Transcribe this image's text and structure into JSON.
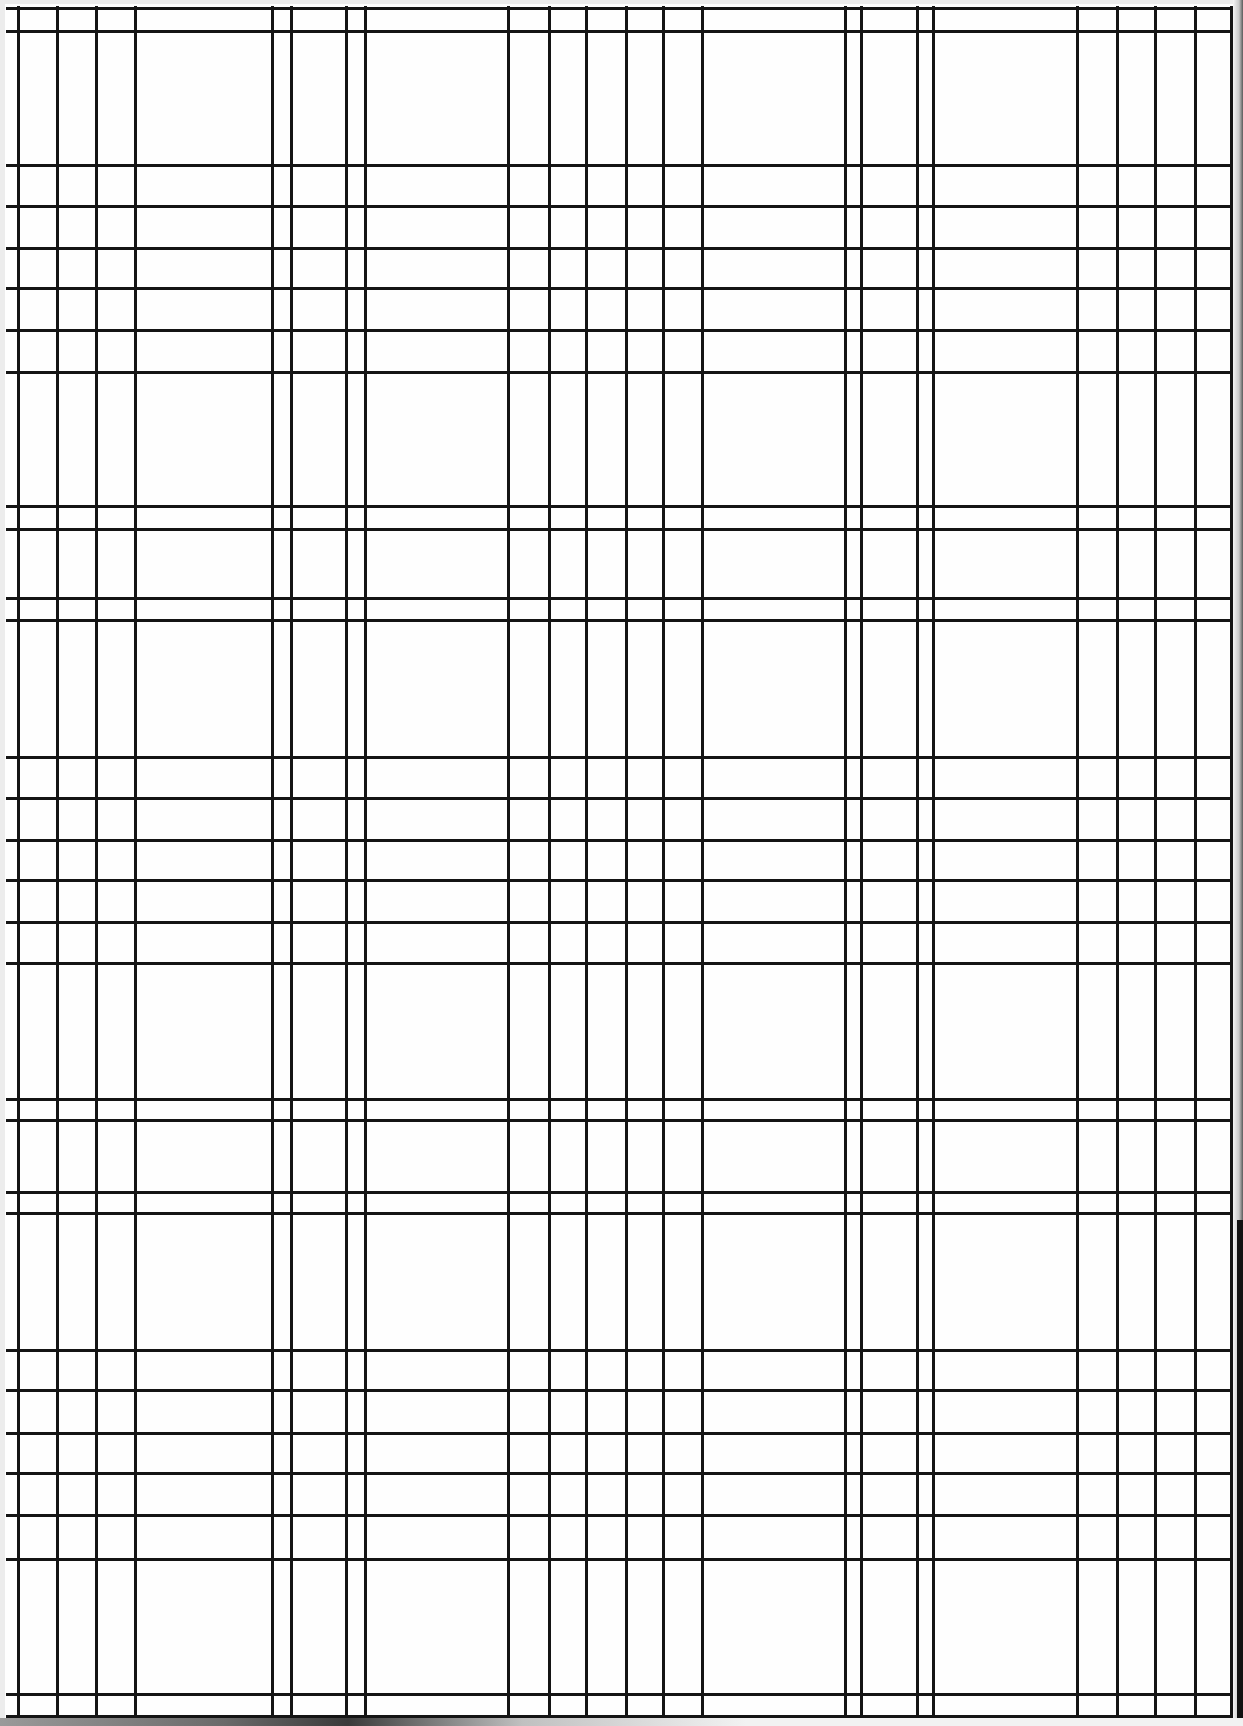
{
  "artwork": {
    "title": "",
    "description": "Hand-drawn black plaid / tartan grid of irregularly spaced vertical and horizontal ink lines on white paper",
    "colors": {
      "paper": "#fefefe",
      "ink": "#141414"
    },
    "vertical_lines_x": [
      18,
      57,
      96,
      135,
      272,
      291,
      346,
      365,
      508,
      549,
      586,
      626,
      663,
      702,
      845,
      861,
      917,
      933,
      1077,
      1117,
      1155,
      1195,
      1231
    ],
    "horizontal_lines_y": [
      8,
      31,
      165,
      206,
      248,
      288,
      330,
      372,
      506,
      529,
      598,
      620,
      757,
      798,
      840,
      880,
      922,
      963,
      1099,
      1120,
      1192,
      1213,
      1350,
      1390,
      1433,
      1473,
      1515,
      1559,
      1694,
      1716
    ]
  }
}
